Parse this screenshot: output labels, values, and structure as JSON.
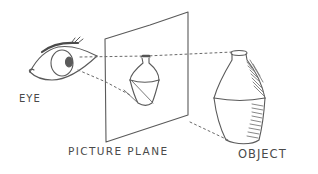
{
  "diagram": {
    "type": "perspective-illustration",
    "style": "hand-drawn pencil sketch",
    "labels": {
      "eye": "EYE",
      "picture_plane": "PICTURE PLANE",
      "object": "OBJECT"
    },
    "elements": [
      {
        "id": "eye",
        "description": "Sketched human eye with lashes, looking right"
      },
      {
        "id": "picture-plane",
        "description": "Transparent rectangular plane shown in perspective"
      },
      {
        "id": "projected-vase",
        "description": "Small vase image projected on the picture plane"
      },
      {
        "id": "object-vase",
        "description": "Larger shaded vase (the real object)"
      },
      {
        "id": "sight-lines",
        "description": "Dotted lines from eye through plane to object top and bottom"
      }
    ],
    "colors": {
      "ink": "#5a5a5a",
      "shading": "#7a7a7a",
      "background": "#ffffff"
    }
  }
}
